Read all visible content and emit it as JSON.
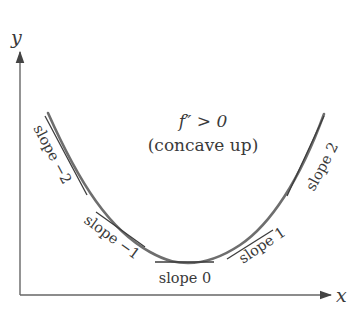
{
  "figure": {
    "title_line1": "f″ > 0",
    "title_line2": "(concave up)",
    "x_axis_label": "x",
    "y_axis_label": "y"
  },
  "tangents": [
    {
      "label": "slope −2",
      "slope": -2
    },
    {
      "label": "slope −1",
      "slope": -1
    },
    {
      "label": "slope 0",
      "slope": 0
    },
    {
      "label": "slope 1",
      "slope": 1
    },
    {
      "label": "slope 2",
      "slope": 2
    }
  ],
  "colors": {
    "curve": "#6e6e6e",
    "tangent": "#3c3c3c",
    "axis": "#555555",
    "text": "#3a3a3a",
    "background": "#ffffff"
  }
}
